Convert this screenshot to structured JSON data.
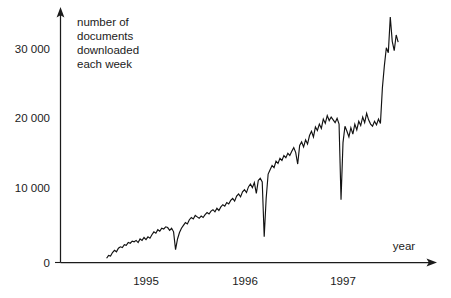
{
  "chart_data": {
    "type": "line",
    "title": "number of documents downloaded each week",
    "title_lines": [
      "number of",
      "documents",
      "downloaded",
      "each week"
    ],
    "xlabel": "year",
    "ylabel": "",
    "grid": false,
    "legend": "none",
    "xlim": [
      1994.55,
      1997.85
    ],
    "ylim": [
      0,
      36000
    ],
    "x_ticks": [
      1995,
      1996,
      1997
    ],
    "x_tick_labels": [
      "1995",
      "1996",
      "1997"
    ],
    "y_ticks": [
      0,
      10000,
      20000,
      30000
    ],
    "y_tick_labels": [
      "0",
      "10 000",
      "20 000",
      "30 000"
    ],
    "series": [
      {
        "name": "documents downloaded each week",
        "color": "#121212",
        "x": [
          1994.6,
          1994.62,
          1994.64,
          1994.66,
          1994.68,
          1994.7,
          1994.72,
          1994.74,
          1994.76,
          1994.78,
          1994.8,
          1994.82,
          1994.84,
          1994.86,
          1994.88,
          1994.9,
          1994.92,
          1994.94,
          1994.96,
          1994.98,
          1995.0,
          1995.02,
          1995.04,
          1995.06,
          1995.08,
          1995.1,
          1995.12,
          1995.14,
          1995.16,
          1995.18,
          1995.2,
          1995.22,
          1995.24,
          1995.26,
          1995.28,
          1995.3,
          1995.32,
          1995.34,
          1995.36,
          1995.38,
          1995.4,
          1995.42,
          1995.44,
          1995.46,
          1995.48,
          1995.5,
          1995.52,
          1995.54,
          1995.56,
          1995.58,
          1995.6,
          1995.62,
          1995.64,
          1995.66,
          1995.68,
          1995.7,
          1995.72,
          1995.74,
          1995.76,
          1995.78,
          1995.8,
          1995.82,
          1995.84,
          1995.86,
          1995.88,
          1995.9,
          1995.92,
          1995.94,
          1995.96,
          1995.98,
          1996.0,
          1996.02,
          1996.04,
          1996.06,
          1996.08,
          1996.1,
          1996.12,
          1996.14,
          1996.16,
          1996.18,
          1996.2,
          1996.22,
          1996.24,
          1996.26,
          1996.28,
          1996.3,
          1996.32,
          1996.34,
          1996.36,
          1996.38,
          1996.4,
          1996.42,
          1996.44,
          1996.46,
          1996.48,
          1996.5,
          1996.52,
          1996.54,
          1996.56,
          1996.58,
          1996.6,
          1996.62,
          1996.64,
          1996.66,
          1996.68,
          1996.7,
          1996.72,
          1996.74,
          1996.76,
          1996.78,
          1996.8,
          1996.82,
          1996.84,
          1996.86,
          1996.88,
          1996.9,
          1996.92,
          1996.94,
          1996.96,
          1996.98,
          1997.0,
          1997.02,
          1997.04,
          1997.06,
          1997.08,
          1997.1,
          1997.12,
          1997.14,
          1997.16,
          1997.18,
          1997.2,
          1997.22,
          1997.24,
          1997.26,
          1997.28,
          1997.3,
          1997.32,
          1997.34,
          1997.36,
          1997.38,
          1997.4,
          1997.42,
          1997.44,
          1997.46,
          1997.48,
          1997.5,
          1997.52,
          1997.54,
          1997.56
        ],
        "y": [
          600,
          1000,
          900,
          1400,
          1700,
          1500,
          2000,
          2200,
          2100,
          2500,
          2400,
          2800,
          2700,
          3000,
          2900,
          3100,
          2800,
          3300,
          3100,
          3500,
          3200,
          3600,
          3400,
          3900,
          4300,
          4100,
          4600,
          4400,
          4800,
          4700,
          5000,
          4900,
          4500,
          4800,
          4300,
          1800,
          3300,
          4200,
          4800,
          5200,
          5600,
          5400,
          6000,
          6300,
          6100,
          6600,
          6400,
          6200,
          6500,
          6300,
          6700,
          7000,
          6800,
          7200,
          7400,
          7100,
          7600,
          7300,
          7800,
          8100,
          7900,
          8400,
          8200,
          8700,
          9000,
          8600,
          9300,
          9600,
          9200,
          9900,
          10200,
          9800,
          10600,
          11000,
          10500,
          11200,
          9700,
          11500,
          11800,
          11300,
          3600,
          9000,
          12400,
          13000,
          13600,
          13300,
          14200,
          13900,
          14600,
          14300,
          15000,
          14700,
          15300,
          15000,
          15600,
          16100,
          15400,
          13800,
          16400,
          16900,
          16200,
          17200,
          16600,
          17800,
          18400,
          17600,
          19000,
          18500,
          19400,
          18800,
          20100,
          19500,
          20600,
          19900,
          20400,
          20000,
          19600,
          20200,
          19400,
          8800,
          16800,
          19100,
          18400,
          17600,
          18900,
          18000,
          19400,
          18600,
          19800,
          19200,
          20400,
          19600,
          20900,
          20000,
          19400,
          19100,
          19800,
          19300,
          20100,
          19500,
          24500,
          27600,
          30100,
          29400,
          34400,
          31000,
          29700,
          31900,
          30900
        ]
      }
    ]
  },
  "axes": {
    "y_axis_name": "value-axis",
    "x_axis_name": "time-axis",
    "x_axis_arrow": "arrow-right",
    "y_axis_arrow": "arrow-up"
  }
}
